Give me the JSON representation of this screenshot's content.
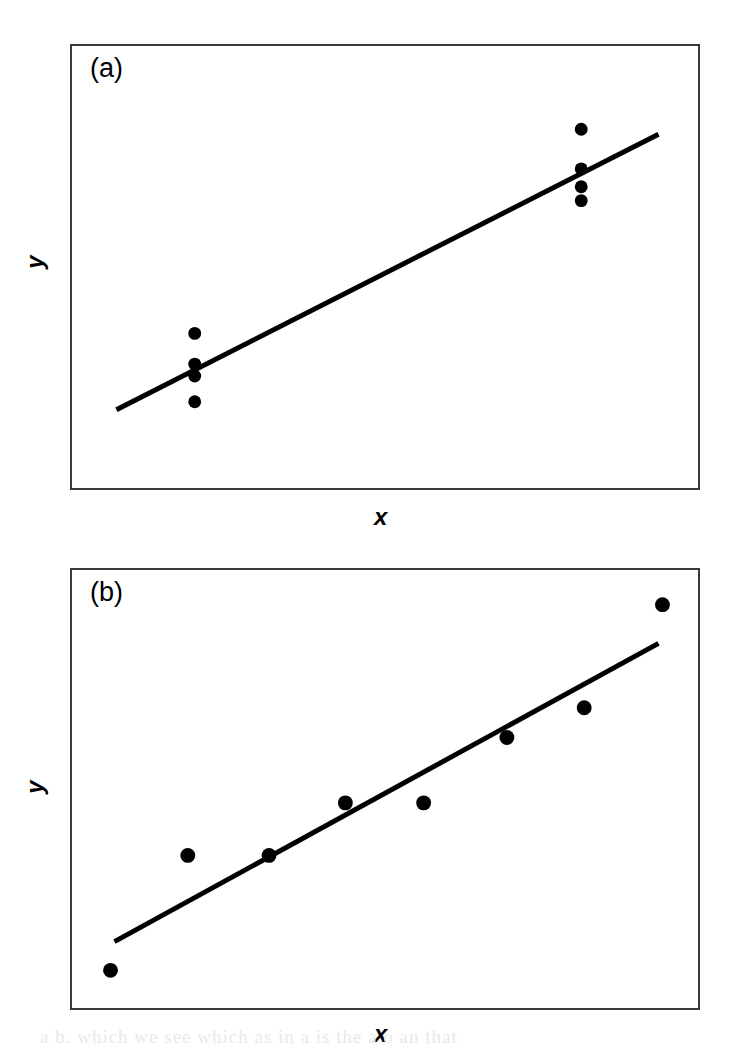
{
  "figure": {
    "background_color": "#ffffff",
    "ink_color": "#000000",
    "border_color": "#3a3a3a",
    "bottom_scan_artifact_text": "a b. which we see which  as in a is the a o an  that"
  },
  "panels": [
    {
      "id": "a",
      "label": "(a)",
      "xlabel": "x",
      "ylabel": "y",
      "frame": {
        "x": 70,
        "y": 44,
        "width": 630,
        "height": 446
      }
    },
    {
      "id": "b",
      "label": "(b)",
      "xlabel": "x",
      "ylabel": "y",
      "frame": {
        "x": 70,
        "y": 568,
        "width": 630,
        "height": 442
      }
    }
  ],
  "chart_data": [
    {
      "type": "scatter",
      "title": "(a)",
      "subtitle": "",
      "xlabel": "x",
      "ylabel": "y",
      "grid": false,
      "legend": null,
      "axis_ticks": {
        "x": [],
        "y": []
      },
      "axis_ranges_note": "unlabelled axes; values are schematic",
      "annotations": [
        "(a)"
      ],
      "description": "Two tight clusters of repeated x values at low and high x, with a fitted straight regression line through them",
      "marker": {
        "shape": "circle",
        "color": "#000000",
        "diameter_px": 13
      },
      "points": [
        {
          "x": 193,
          "y": 334
        },
        {
          "x": 193,
          "y": 365
        },
        {
          "x": 193,
          "y": 377
        },
        {
          "x": 193,
          "y": 403
        },
        {
          "x": 583,
          "y": 128
        },
        {
          "x": 583,
          "y": 168
        },
        {
          "x": 583,
          "y": 186
        },
        {
          "x": 583,
          "y": 200
        }
      ],
      "fit_line": {
        "label": "regression line",
        "color": "#000000",
        "width_px": 5,
        "x1": 114,
        "y1": 411,
        "x2": 661,
        "y2": 133
      }
    },
    {
      "type": "scatter",
      "title": "(b)",
      "subtitle": "",
      "xlabel": "x",
      "ylabel": "y",
      "grid": false,
      "legend": null,
      "axis_ticks": {
        "x": [],
        "y": []
      },
      "axis_ranges_note": "unlabelled axes; values are schematic",
      "annotations": [
        "(b)"
      ],
      "description": "Eight points spread evenly across the x range rising steadily, with a fitted straight regression line",
      "marker": {
        "shape": "circle",
        "color": "#000000",
        "diameter_px": 15
      },
      "points": [
        {
          "x": 108,
          "y": 972
        },
        {
          "x": 186,
          "y": 856
        },
        {
          "x": 268,
          "y": 856
        },
        {
          "x": 345,
          "y": 803
        },
        {
          "x": 424,
          "y": 803
        },
        {
          "x": 508,
          "y": 737
        },
        {
          "x": 586,
          "y": 707
        },
        {
          "x": 665,
          "y": 603
        }
      ],
      "fit_line": {
        "label": "regression line",
        "color": "#000000",
        "width_px": 5,
        "x1": 112,
        "y1": 943,
        "x2": 661,
        "y2": 642
      }
    }
  ]
}
